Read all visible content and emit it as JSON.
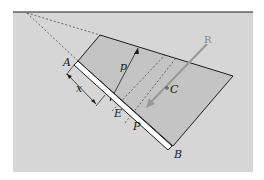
{
  "figure": {
    "type": "hydrostatic-pressure-on-inclined-plate",
    "colors": {
      "background_fluid": "#d6d6d6",
      "pressure_region": "#c4c4c4",
      "plate_fill": "#ffffff",
      "line": "#1e1e1e",
      "resultant_arrow": "#9a9a9a",
      "dashed": "#3a3a3a"
    },
    "labels": {
      "A": "A",
      "B": "B",
      "E": "E",
      "P": "P",
      "C": "C",
      "R": "R",
      "x": "x",
      "p": "p"
    },
    "elements": {
      "free_surface": "free surface line",
      "plate": "plate AB",
      "pressure_diagram": "pressure distribution trapezoid",
      "resultant": "resultant force R",
      "centroid": "centroid C",
      "strip": "element at distance x",
      "projection_lines": "dashed projection lines to pivot"
    }
  }
}
